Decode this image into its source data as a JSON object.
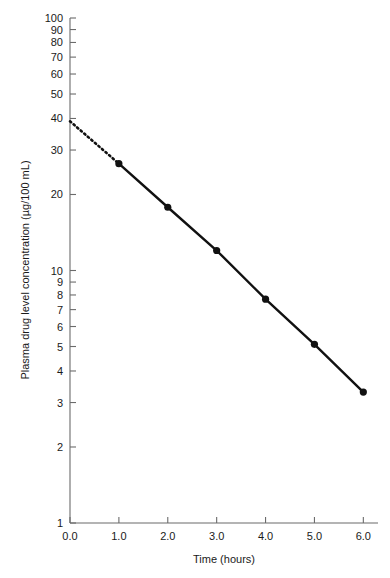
{
  "chart_data": {
    "type": "line",
    "title": "",
    "xlabel": "Time (hours)",
    "ylabel": "Plasma drug level concentration (µg/100 mL)",
    "yscale": "log",
    "xscale": "linear",
    "xlim": [
      0.0,
      6.3
    ],
    "ylim": [
      1,
      100
    ],
    "grid": false,
    "legend": null,
    "x": [
      0.0,
      1.0,
      2.0,
      3.0,
      4.0,
      5.0,
      6.0
    ],
    "values": [
      39.0,
      26.5,
      17.8,
      12.0,
      7.7,
      5.1,
      3.3
    ],
    "series": [
      {
        "name": "Plasma drug level",
        "x": [
          1.0,
          2.0,
          3.0,
          4.0,
          5.0,
          6.0
        ],
        "values": [
          26.5,
          17.8,
          12.0,
          7.7,
          5.1,
          3.3
        ],
        "style": "solid",
        "marker": "filled-circle",
        "color": "#111111"
      },
      {
        "name": "Extrapolated back-projection",
        "x": [
          0.0,
          1.0
        ],
        "values": [
          39.0,
          26.5
        ],
        "style": "dotted",
        "marker": "none",
        "color": "#111111"
      }
    ],
    "xticks": [
      0.0,
      1.0,
      2.0,
      3.0,
      4.0,
      5.0,
      6.0
    ],
    "xticklabels": [
      "0.0",
      "1.0",
      "2.0",
      "3.0",
      "4.0",
      "5.0",
      "6.0"
    ],
    "yticks": [
      1,
      2,
      3,
      4,
      5,
      6,
      7,
      8,
      9,
      10,
      20,
      30,
      40,
      50,
      60,
      70,
      80,
      90,
      100
    ],
    "yticklabels": [
      "1",
      "2",
      "3",
      "4",
      "5",
      "6",
      "7",
      "8",
      "9",
      "10",
      "20",
      "30",
      "40",
      "50",
      "60",
      "70",
      "80",
      "90",
      "100"
    ],
    "annotations": []
  },
  "colors": {
    "data": "#111111",
    "axis": "#6b6b6b",
    "text": "#1a1a1a",
    "background": "#ffffff"
  }
}
